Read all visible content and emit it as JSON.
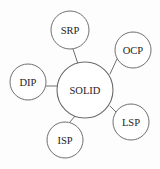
{
  "diagram": {
    "type": "node-link",
    "background_color": "#fdfdfd",
    "stroke_color": "#707070",
    "text_color": "#1d1d1d",
    "hub": {
      "id": "solid",
      "label": "SOLID",
      "cx": 85,
      "cy": 90,
      "r": 28
    },
    "nodes": [
      {
        "id": "srp",
        "label": "SRP",
        "cx": 70,
        "cy": 30,
        "r": 19
      },
      {
        "id": "ocp",
        "label": "OCP",
        "cx": 133,
        "cy": 50,
        "r": 18
      },
      {
        "id": "lsp",
        "label": "LSP",
        "cx": 131,
        "cy": 122,
        "r": 18
      },
      {
        "id": "isp",
        "label": "ISP",
        "cx": 65,
        "cy": 140,
        "r": 18
      },
      {
        "id": "dip",
        "label": "DIP",
        "cx": 28,
        "cy": 82,
        "r": 18
      }
    ],
    "edges": [
      {
        "id": "edge-solid-srp",
        "from": "solid",
        "to": "srp",
        "x1": 78,
        "y1": 64,
        "x2": 73,
        "y2": 49
      },
      {
        "id": "edge-solid-ocp",
        "from": "solid",
        "to": "ocp",
        "x1": 110,
        "y1": 74,
        "x2": 117,
        "y2": 59
      },
      {
        "id": "edge-solid-lsp",
        "from": "solid",
        "to": "lsp",
        "x1": 110,
        "y1": 106,
        "x2": 116,
        "y2": 112
      },
      {
        "id": "edge-solid-isp",
        "from": "solid",
        "to": "isp",
        "x1": 75,
        "y1": 116,
        "x2": 70,
        "y2": 122
      },
      {
        "id": "edge-solid-dip",
        "from": "solid",
        "to": "dip",
        "x1": 46,
        "y1": 86,
        "x2": 57,
        "y2": 86
      }
    ]
  }
}
